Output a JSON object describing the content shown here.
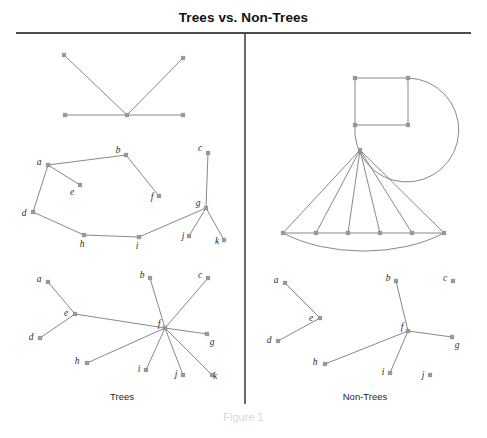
{
  "figure": {
    "title": "Trees vs. Non-Trees",
    "figure_number": "Figure 1",
    "left_panel_caption": "Trees",
    "right_panel_caption": "Non-Trees",
    "node_color": "#9a9a9a",
    "edge_color": "#7b7b7b",
    "rule_color": "#111111",
    "background": "#ffffff"
  },
  "layout": {
    "width": 487,
    "height": 438,
    "title_rule_y": 33,
    "divider_x": 245,
    "divider_y_top": 34,
    "divider_y_bottom": 404
  },
  "graphs": [
    {
      "id": "tree-star-5",
      "panel": "trees",
      "label": "",
      "nodes": [
        {
          "id": "n1",
          "label": "",
          "x": 64,
          "y": 55,
          "label_dx": 0,
          "label_dy": 0
        },
        {
          "id": "n2",
          "label": "",
          "x": 183,
          "y": 58,
          "label_dx": 0,
          "label_dy": 0
        },
        {
          "id": "n3",
          "label": "",
          "x": 65,
          "y": 115,
          "label_dx": 0,
          "label_dy": 0
        },
        {
          "id": "n4",
          "label": "",
          "x": 127,
          "y": 115,
          "label_dx": 0,
          "label_dy": 0
        },
        {
          "id": "n5",
          "label": "",
          "x": 183,
          "y": 115,
          "label_dx": 0,
          "label_dy": 0
        }
      ],
      "edges": [
        [
          "n1",
          "n4"
        ],
        [
          "n2",
          "n4"
        ],
        [
          "n3",
          "n4"
        ],
        [
          "n4",
          "n5"
        ]
      ],
      "arcs": []
    },
    {
      "id": "tree-labeled-abcdefghijk",
      "panel": "trees",
      "label": "",
      "nodes": [
        {
          "id": "a",
          "label": "a",
          "x": 48,
          "y": 165,
          "label_dx": -9,
          "label_dy": -2
        },
        {
          "id": "b",
          "label": "b",
          "x": 126,
          "y": 155,
          "label_dx": -8,
          "label_dy": -4
        },
        {
          "id": "c",
          "label": "c",
          "x": 208,
          "y": 153,
          "label_dx": -8,
          "label_dy": -4
        },
        {
          "id": "d",
          "label": "d",
          "x": 33,
          "y": 212,
          "label_dx": -9,
          "label_dy": 2
        },
        {
          "id": "e",
          "label": "e",
          "x": 80,
          "y": 185,
          "label_dx": -8,
          "label_dy": 8
        },
        {
          "id": "f",
          "label": "f",
          "x": 159,
          "y": 196,
          "label_dx": -7,
          "label_dy": 2
        },
        {
          "id": "g",
          "label": "g",
          "x": 206,
          "y": 208,
          "label_dx": -8,
          "label_dy": -4
        },
        {
          "id": "h",
          "label": "h",
          "x": 84,
          "y": 235,
          "label_dx": -2,
          "label_dy": 10
        },
        {
          "id": "i",
          "label": "i",
          "x": 139,
          "y": 237,
          "label_dx": -2,
          "label_dy": 10
        },
        {
          "id": "j",
          "label": "j",
          "x": 189,
          "y": 236,
          "label_dx": -6,
          "label_dy": 1
        },
        {
          "id": "k",
          "label": "k",
          "x": 224,
          "y": 240,
          "label_dx": -7,
          "label_dy": 2
        }
      ],
      "edges": [
        [
          "a",
          "b"
        ],
        [
          "a",
          "e"
        ],
        [
          "a",
          "d"
        ],
        [
          "b",
          "f"
        ],
        [
          "d",
          "h"
        ],
        [
          "h",
          "i"
        ],
        [
          "i",
          "g"
        ],
        [
          "g",
          "c"
        ],
        [
          "g",
          "j"
        ],
        [
          "g",
          "k"
        ]
      ],
      "arcs": []
    },
    {
      "id": "tree-double-star-ef",
      "panel": "trees",
      "label": "",
      "nodes": [
        {
          "id": "a",
          "label": "a",
          "x": 48,
          "y": 282,
          "label_dx": -9,
          "label_dy": -2
        },
        {
          "id": "b",
          "label": "b",
          "x": 150,
          "y": 278,
          "label_dx": -8,
          "label_dy": -2
        },
        {
          "id": "c",
          "label": "c",
          "x": 208,
          "y": 278,
          "label_dx": -8,
          "label_dy": -2
        },
        {
          "id": "d",
          "label": "d",
          "x": 40,
          "y": 338,
          "label_dx": -9,
          "label_dy": 0
        },
        {
          "id": "e",
          "label": "e",
          "x": 75,
          "y": 314,
          "label_dx": -9,
          "label_dy": 0
        },
        {
          "id": "f",
          "label": "f",
          "x": 165,
          "y": 328,
          "label_dx": -6,
          "label_dy": -3
        },
        {
          "id": "g",
          "label": "g",
          "x": 207,
          "y": 334,
          "label_dx": 5,
          "label_dy": 9
        },
        {
          "id": "h",
          "label": "h",
          "x": 87,
          "y": 363,
          "label_dx": -10,
          "label_dy": -1
        },
        {
          "id": "i",
          "label": "i",
          "x": 146,
          "y": 370,
          "label_dx": -7,
          "label_dy": 0
        },
        {
          "id": "j",
          "label": "j",
          "x": 183,
          "y": 375,
          "label_dx": -7,
          "label_dy": 0
        },
        {
          "id": "k",
          "label": "k",
          "x": 212,
          "y": 375,
          "label_dx": 3,
          "label_dy": 2
        }
      ],
      "edges": [
        [
          "a",
          "e"
        ],
        [
          "d",
          "e"
        ],
        [
          "e",
          "f"
        ],
        [
          "b",
          "f"
        ],
        [
          "c",
          "f"
        ],
        [
          "f",
          "g"
        ],
        [
          "f",
          "h"
        ],
        [
          "f",
          "i"
        ],
        [
          "f",
          "j"
        ],
        [
          "f",
          "k"
        ]
      ],
      "arcs": []
    },
    {
      "id": "nontree-square-with-arc",
      "panel": "non-trees",
      "label": "",
      "nodes": [
        {
          "id": "tl",
          "label": "",
          "x": 355,
          "y": 78,
          "label_dx": 0,
          "label_dy": 0
        },
        {
          "id": "tr",
          "label": "",
          "x": 408,
          "y": 78,
          "label_dx": 0,
          "label_dy": 0
        },
        {
          "id": "bl",
          "label": "",
          "x": 355,
          "y": 125,
          "label_dx": 0,
          "label_dy": 0
        },
        {
          "id": "br",
          "label": "",
          "x": 408,
          "y": 125,
          "label_dx": 0,
          "label_dy": 0
        }
      ],
      "edges": [
        [
          "tl",
          "tr"
        ],
        [
          "tl",
          "bl"
        ],
        [
          "tr",
          "br"
        ],
        [
          "bl",
          "br"
        ]
      ],
      "arcs": [
        {
          "from": "tr",
          "to": "bl",
          "rx": 52,
          "ry": 52,
          "large_arc": 1,
          "sweep": 1
        }
      ]
    },
    {
      "id": "nontree-fan-cycle",
      "panel": "non-trees",
      "label": "",
      "nodes": [
        {
          "id": "apex",
          "label": "",
          "x": 360,
          "y": 150,
          "label_dx": 0,
          "label_dy": 0
        },
        {
          "id": "p1",
          "label": "",
          "x": 283,
          "y": 233,
          "label_dx": 0,
          "label_dy": 0
        },
        {
          "id": "p2",
          "label": "",
          "x": 316,
          "y": 233,
          "label_dx": 0,
          "label_dy": 0
        },
        {
          "id": "p3",
          "label": "",
          "x": 348,
          "y": 233,
          "label_dx": 0,
          "label_dy": 0
        },
        {
          "id": "p4",
          "label": "",
          "x": 380,
          "y": 233,
          "label_dx": 0,
          "label_dy": 0
        },
        {
          "id": "p5",
          "label": "",
          "x": 412,
          "y": 233,
          "label_dx": 0,
          "label_dy": 0
        },
        {
          "id": "p6",
          "label": "",
          "x": 444,
          "y": 233,
          "label_dx": 0,
          "label_dy": 0
        }
      ],
      "edges": [
        [
          "apex",
          "p1"
        ],
        [
          "apex",
          "p2"
        ],
        [
          "apex",
          "p3"
        ],
        [
          "apex",
          "p4"
        ],
        [
          "apex",
          "p5"
        ],
        [
          "apex",
          "p6"
        ],
        [
          "p1",
          "p2"
        ],
        [
          "p2",
          "p3"
        ],
        [
          "p3",
          "p4"
        ],
        [
          "p4",
          "p5"
        ],
        [
          "p5",
          "p6"
        ]
      ],
      "arcs": [
        {
          "from": "p1",
          "to": "p6",
          "rx": 120,
          "ry": 70,
          "large_arc": 0,
          "sweep": 0
        }
      ]
    },
    {
      "id": "nontree-forest",
      "panel": "non-trees",
      "label": "",
      "nodes": [
        {
          "id": "a",
          "label": "a",
          "x": 285,
          "y": 283,
          "label_dx": -9,
          "label_dy": -2
        },
        {
          "id": "b",
          "label": "b",
          "x": 396,
          "y": 281,
          "label_dx": -8,
          "label_dy": -2
        },
        {
          "id": "c",
          "label": "c",
          "x": 453,
          "y": 281,
          "label_dx": -8,
          "label_dy": -2
        },
        {
          "id": "d",
          "label": "d",
          "x": 278,
          "y": 341,
          "label_dx": -9,
          "label_dy": 0
        },
        {
          "id": "e",
          "label": "e",
          "x": 320,
          "y": 318,
          "label_dx": -9,
          "label_dy": 1
        },
        {
          "id": "f",
          "label": "f",
          "x": 408,
          "y": 331,
          "label_dx": -6,
          "label_dy": -3
        },
        {
          "id": "g",
          "label": "g",
          "x": 452,
          "y": 337,
          "label_dx": 5,
          "label_dy": 9
        },
        {
          "id": "h",
          "label": "h",
          "x": 325,
          "y": 364,
          "label_dx": -10,
          "label_dy": -1
        },
        {
          "id": "i",
          "label": "i",
          "x": 390,
          "y": 373,
          "label_dx": -7,
          "label_dy": 0
        },
        {
          "id": "j",
          "label": "j",
          "x": 430,
          "y": 375,
          "label_dx": -7,
          "label_dy": 1
        }
      ],
      "edges": [
        [
          "a",
          "e"
        ],
        [
          "d",
          "e"
        ],
        [
          "b",
          "f"
        ],
        [
          "f",
          "g"
        ],
        [
          "f",
          "h"
        ],
        [
          "f",
          "i"
        ]
      ],
      "arcs": []
    }
  ]
}
